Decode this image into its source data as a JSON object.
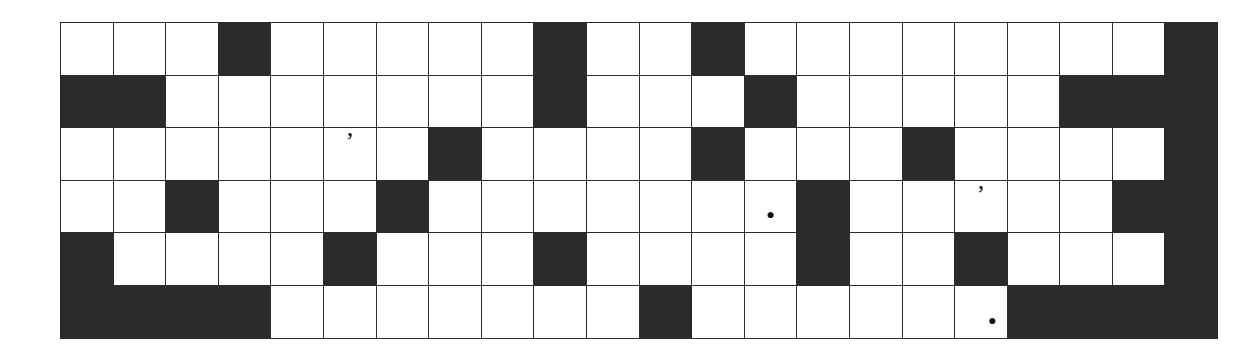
{
  "puzzle": {
    "title": "Crossword Grid",
    "rows": 6,
    "columns": 22,
    "cell_size_px": 51.6,
    "colors": {
      "block": "#2b2b2b",
      "open": "#ffffff",
      "grid_line": "#2b2b2b",
      "page_background": "#ffffff"
    },
    "legend": {
      "open_cell": "open",
      "block_cell": "block"
    },
    "marks": {
      "apostrophe": "’",
      "period": "•"
    },
    "grid": [
      [
        {
          "t": "open"
        },
        {
          "t": "open"
        },
        {
          "t": "open"
        },
        {
          "t": "block"
        },
        {
          "t": "open"
        },
        {
          "t": "open"
        },
        {
          "t": "open"
        },
        {
          "t": "open"
        },
        {
          "t": "open"
        },
        {
          "t": "block"
        },
        {
          "t": "open"
        },
        {
          "t": "open"
        },
        {
          "t": "block"
        },
        {
          "t": "open"
        },
        {
          "t": "open"
        },
        {
          "t": "open"
        },
        {
          "t": "open"
        },
        {
          "t": "open"
        },
        {
          "t": "open"
        },
        {
          "t": "open"
        },
        {
          "t": "open"
        },
        {
          "t": "block"
        }
      ],
      [
        {
          "t": "block"
        },
        {
          "t": "block"
        },
        {
          "t": "open"
        },
        {
          "t": "open"
        },
        {
          "t": "open"
        },
        {
          "t": "open"
        },
        {
          "t": "open"
        },
        {
          "t": "open"
        },
        {
          "t": "open"
        },
        {
          "t": "block"
        },
        {
          "t": "open"
        },
        {
          "t": "open"
        },
        {
          "t": "open"
        },
        {
          "t": "block"
        },
        {
          "t": "open"
        },
        {
          "t": "open"
        },
        {
          "t": "open"
        },
        {
          "t": "open"
        },
        {
          "t": "open"
        },
        {
          "t": "block"
        },
        {
          "t": "block"
        },
        {
          "t": "block"
        }
      ],
      [
        {
          "t": "open"
        },
        {
          "t": "open"
        },
        {
          "t": "open"
        },
        {
          "t": "open"
        },
        {
          "t": "open"
        },
        {
          "t": "open",
          "mark": "apostrophe",
          "mark_pos": "top"
        },
        {
          "t": "open"
        },
        {
          "t": "block"
        },
        {
          "t": "open"
        },
        {
          "t": "open"
        },
        {
          "t": "open"
        },
        {
          "t": "open"
        },
        {
          "t": "block"
        },
        {
          "t": "open"
        },
        {
          "t": "open"
        },
        {
          "t": "open"
        },
        {
          "t": "block"
        },
        {
          "t": "open"
        },
        {
          "t": "open"
        },
        {
          "t": "open"
        },
        {
          "t": "open"
        },
        {
          "t": "block"
        }
      ],
      [
        {
          "t": "open"
        },
        {
          "t": "open"
        },
        {
          "t": "block"
        },
        {
          "t": "open"
        },
        {
          "t": "open"
        },
        {
          "t": "open"
        },
        {
          "t": "block"
        },
        {
          "t": "open"
        },
        {
          "t": "open"
        },
        {
          "t": "open"
        },
        {
          "t": "open"
        },
        {
          "t": "open"
        },
        {
          "t": "open"
        },
        {
          "t": "open",
          "mark": "period",
          "mark_pos": "bottom"
        },
        {
          "t": "block"
        },
        {
          "t": "open"
        },
        {
          "t": "open"
        },
        {
          "t": "open",
          "mark": "apostrophe",
          "mark_pos": "top"
        },
        {
          "t": "open"
        },
        {
          "t": "open"
        },
        {
          "t": "block"
        },
        {
          "t": "block"
        }
      ],
      [
        {
          "t": "block"
        },
        {
          "t": "open"
        },
        {
          "t": "open"
        },
        {
          "t": "open"
        },
        {
          "t": "open"
        },
        {
          "t": "block"
        },
        {
          "t": "open"
        },
        {
          "t": "open"
        },
        {
          "t": "open"
        },
        {
          "t": "block"
        },
        {
          "t": "open"
        },
        {
          "t": "open"
        },
        {
          "t": "open"
        },
        {
          "t": "open"
        },
        {
          "t": "block"
        },
        {
          "t": "open"
        },
        {
          "t": "open"
        },
        {
          "t": "block"
        },
        {
          "t": "open"
        },
        {
          "t": "open"
        },
        {
          "t": "open"
        },
        {
          "t": "block"
        }
      ],
      [
        {
          "t": "block"
        },
        {
          "t": "block"
        },
        {
          "t": "block"
        },
        {
          "t": "block"
        },
        {
          "t": "open"
        },
        {
          "t": "open"
        },
        {
          "t": "open"
        },
        {
          "t": "open"
        },
        {
          "t": "open"
        },
        {
          "t": "open"
        },
        {
          "t": "open"
        },
        {
          "t": "block"
        },
        {
          "t": "open"
        },
        {
          "t": "open"
        },
        {
          "t": "open"
        },
        {
          "t": "open"
        },
        {
          "t": "open"
        },
        {
          "t": "open",
          "mark": "period",
          "mark_pos": "bottom-right"
        },
        {
          "t": "block"
        },
        {
          "t": "block"
        },
        {
          "t": "block"
        },
        {
          "t": "block"
        }
      ]
    ]
  }
}
